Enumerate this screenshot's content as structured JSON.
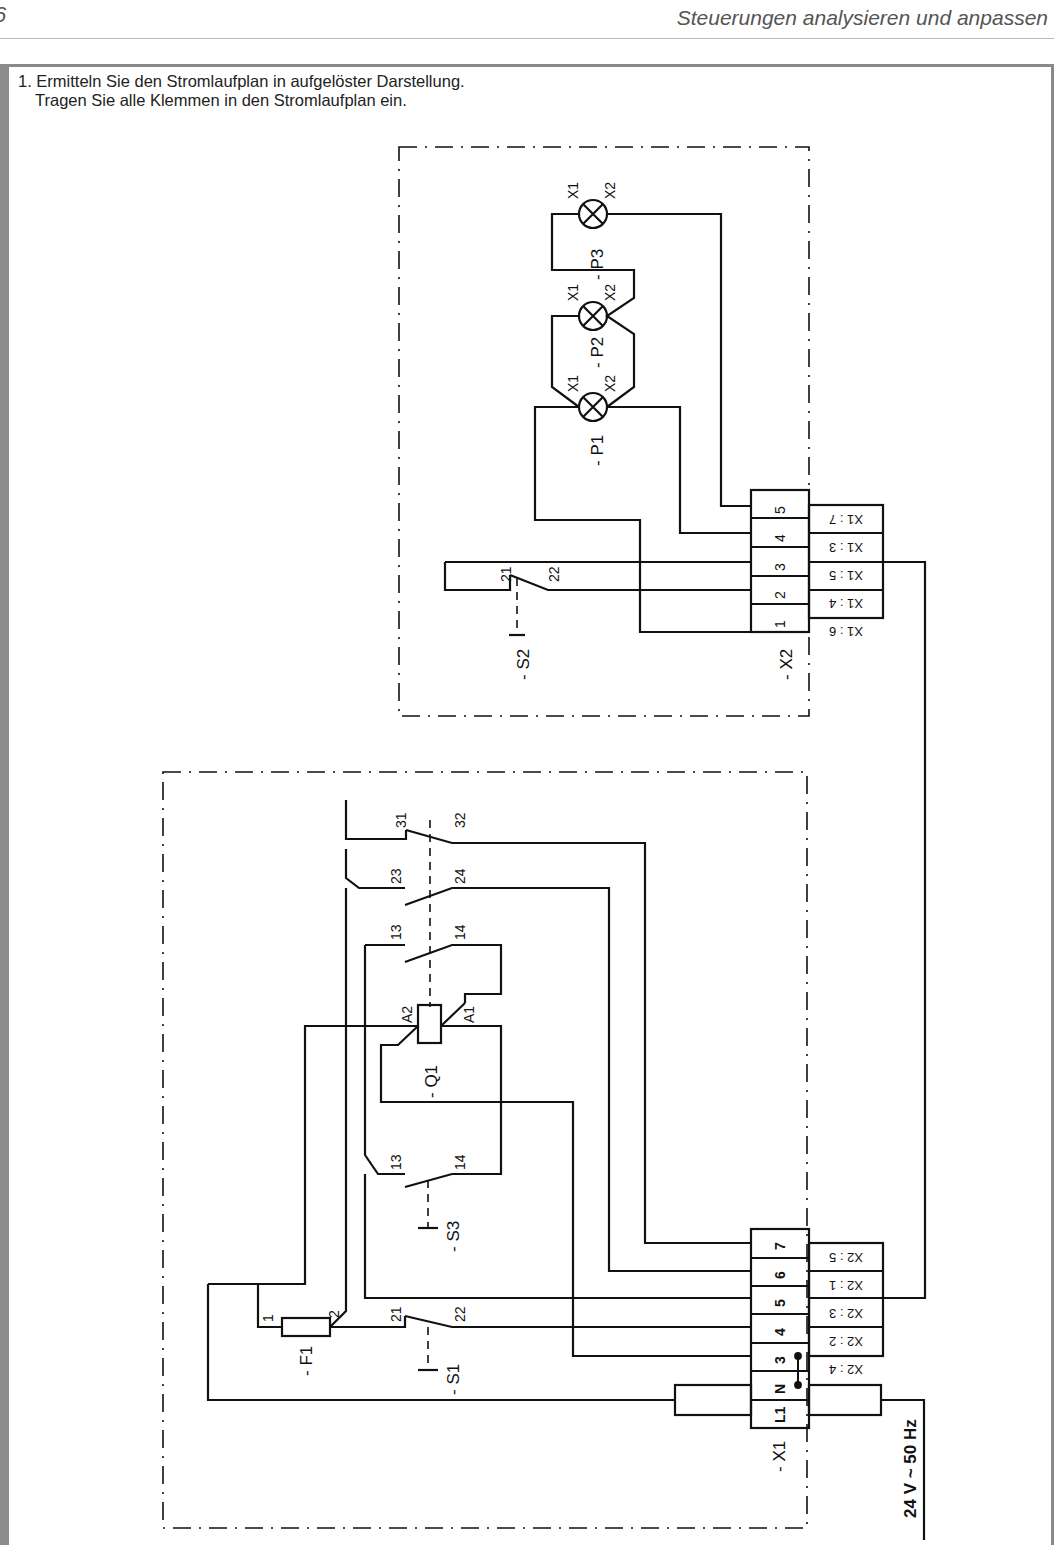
{
  "page": {
    "page_number": "6",
    "running_head": "Steuerungen analysieren und anpassen"
  },
  "task": {
    "line1": "1. Ermitteln Sie den Stromlaufplan in aufgelöster Darstellung.",
    "line2": "Tragen Sie alle Klemmen in den Stromlaufplan ein."
  },
  "upper_unit": {
    "lamps": [
      {
        "id": "- P1",
        "terminals": [
          "X1",
          "X2"
        ]
      },
      {
        "id": "- P2",
        "terminals": [
          "X1",
          "X2"
        ]
      },
      {
        "id": "- P3",
        "terminals": [
          "X1",
          "X2"
        ]
      }
    ],
    "switch": {
      "id": "- S2",
      "contacts": [
        "21",
        "22"
      ]
    },
    "terminal_strip": {
      "id": "- X2",
      "terminals": [
        "1",
        "2",
        "3",
        "4",
        "5"
      ],
      "cross_refs": [
        "X1 : 6",
        "X1 : 4",
        "X1 : 5",
        "X1 : 3",
        "X1 : 7"
      ]
    }
  },
  "lower_unit": {
    "contactor": {
      "id": "- Q1",
      "coil": [
        "A1",
        "A2"
      ],
      "contacts": [
        "13",
        "14",
        "23",
        "24",
        "31",
        "32"
      ]
    },
    "switch_s3": {
      "id": "- S3",
      "contacts": [
        "13",
        "14"
      ]
    },
    "switch_s1": {
      "id": "- S1",
      "contacts": [
        "21",
        "22"
      ]
    },
    "fuse": {
      "id": "- F1",
      "terminals": [
        "1",
        "2"
      ]
    },
    "terminal_strip": {
      "id": "- X1",
      "terminals": [
        "L1",
        "N",
        "3",
        "4",
        "5",
        "6",
        "7"
      ],
      "cross_refs": [
        "X2 : 4",
        "X2 : 2",
        "X2 : 3",
        "X2 : 1",
        "X2 : 5"
      ]
    }
  },
  "supply": {
    "label": "24 V ~ 50 Hz"
  },
  "colors": {
    "line": "#111111",
    "frame": "#8a8a8a"
  }
}
